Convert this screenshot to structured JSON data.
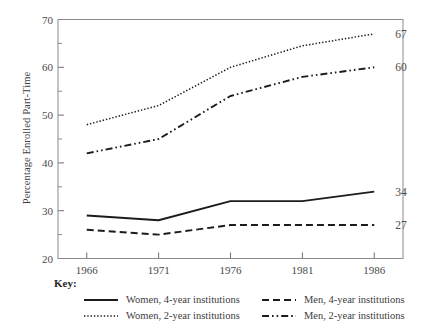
{
  "chart_data": {
    "type": "line",
    "title": "",
    "xlabel": "",
    "ylabel": "Percentage Enrolled Part-Time",
    "x": [
      1966,
      1971,
      1976,
      1981,
      1986
    ],
    "categories": [
      "1966",
      "1971",
      "1976",
      "1981",
      "1986"
    ],
    "xlim": [
      1964,
      1988
    ],
    "ylim": [
      20,
      70
    ],
    "y_major_ticks": [
      20,
      30,
      40,
      50,
      60,
      70
    ],
    "y_minor_ticks": [
      25,
      35,
      45,
      55,
      65
    ],
    "y_tick_labels": [
      "20",
      "30",
      "40",
      "50",
      "60",
      "70"
    ],
    "x_tick_labels": [
      "1966",
      "1971",
      "1976",
      "1981",
      "1986"
    ],
    "grid": false,
    "legend_position": "below",
    "legend_title": "Key:",
    "series": [
      {
        "name": "Women, 4-year institutions",
        "style": "solid",
        "values": [
          29,
          28,
          32,
          32,
          34
        ],
        "end_label": "34"
      },
      {
        "name": "Men, 4-year institutions",
        "style": "dashed",
        "values": [
          26,
          25,
          27,
          27,
          27
        ],
        "end_label": "27"
      },
      {
        "name": "Women, 2-year institutions",
        "style": "dotted",
        "values": [
          48,
          52,
          60,
          64.5,
          67
        ],
        "end_label": "67"
      },
      {
        "name": "Men, 2-year institutions",
        "style": "dash-dot",
        "values": [
          42,
          45,
          54,
          58,
          60
        ],
        "end_label": "60"
      }
    ]
  },
  "legend": {
    "title": "Key:",
    "entries": [
      {
        "label": "Women, 4-year institutions",
        "style": "solid"
      },
      {
        "label": "Men, 4-year institutions",
        "style": "dashed"
      },
      {
        "label": "Women, 2-year institutions",
        "style": "dotted"
      },
      {
        "label": "Men, 2-year institutions",
        "style": "dash-dot"
      }
    ]
  },
  "colors": {
    "line": "#1c1c1c",
    "axis": "#8a8a8a",
    "text": "#3c3c3c",
    "background": "#ffffff"
  }
}
